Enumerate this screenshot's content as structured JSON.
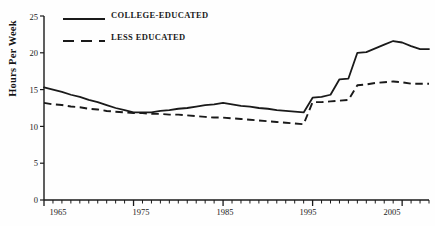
{
  "chart_data": {
    "type": "line",
    "title": "",
    "xlabel": "",
    "ylabel": "Hours Per Week",
    "xlim": [
      1965,
      2008
    ],
    "ylim": [
      0,
      25
    ],
    "grid": false,
    "legend_position": "top-left",
    "yticks": [
      0,
      5,
      10,
      15,
      20,
      25
    ],
    "ytick_labels": [
      "0",
      "5",
      "10",
      "15",
      "20",
      "25"
    ],
    "xticks": [
      1965,
      1975,
      1985,
      1995,
      2005
    ],
    "xtick_labels": [
      "1965",
      "1975",
      "1985",
      "1995",
      "2005"
    ],
    "xminor_tick_interval": 1,
    "x": [
      1965,
      1966,
      1967,
      1968,
      1969,
      1970,
      1971,
      1972,
      1973,
      1974,
      1975,
      1976,
      1977,
      1978,
      1979,
      1980,
      1981,
      1982,
      1983,
      1984,
      1985,
      1986,
      1987,
      1988,
      1989,
      1990,
      1991,
      1992,
      1993,
      1994,
      1995,
      1996,
      1997,
      1998,
      1999,
      2000,
      2001,
      2002,
      2003,
      2004,
      2005,
      2006,
      2007,
      2008
    ],
    "series": [
      {
        "name": "COLLEGE-EDUCATED",
        "style": "solid",
        "color": "#1a1a1a",
        "values": [
          15.3,
          15.0,
          14.7,
          14.3,
          14.0,
          13.6,
          13.3,
          12.9,
          12.5,
          12.2,
          11.9,
          11.9,
          11.9,
          12.1,
          12.2,
          12.4,
          12.5,
          12.7,
          12.9,
          13.0,
          13.2,
          13.0,
          12.8,
          12.7,
          12.5,
          12.4,
          12.2,
          12.1,
          12.0,
          11.9,
          13.9,
          14.0,
          14.3,
          16.4,
          16.5,
          20.0,
          20.1,
          20.6,
          21.1,
          21.6,
          21.4,
          20.9,
          20.5,
          20.5
        ]
      },
      {
        "name": "LESS EDUCATED",
        "style": "dashed",
        "color": "#1a1a1a",
        "values": [
          13.2,
          13.0,
          12.9,
          12.7,
          12.6,
          12.4,
          12.3,
          12.1,
          12.0,
          11.9,
          11.8,
          11.8,
          11.7,
          11.7,
          11.6,
          11.6,
          11.5,
          11.4,
          11.3,
          11.2,
          11.2,
          11.1,
          11.0,
          10.9,
          10.8,
          10.7,
          10.6,
          10.5,
          10.4,
          10.3,
          13.3,
          13.3,
          13.4,
          13.5,
          13.6,
          15.6,
          15.7,
          15.9,
          16.0,
          16.1,
          16.0,
          15.8,
          15.8,
          15.8
        ]
      }
    ],
    "annotations": []
  },
  "legend": {
    "entries": [
      {
        "label": "COLLEGE-EDUCATED",
        "swatch": "solid-line-swatch"
      },
      {
        "label": "LESS EDUCATED",
        "swatch": "dashed-line-swatch"
      }
    ]
  },
  "axes": {
    "y_title": "Hours Per Week"
  }
}
